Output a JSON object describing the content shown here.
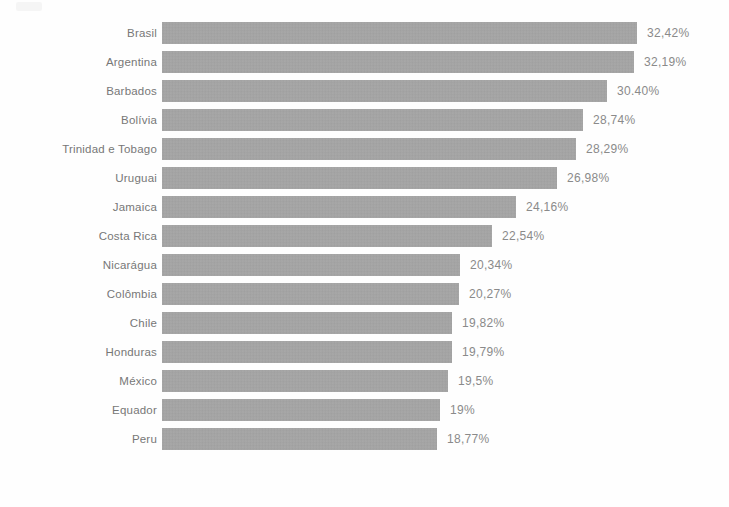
{
  "chart_data": {
    "type": "bar",
    "orientation": "horizontal",
    "title": "",
    "subtitle": "",
    "xlabel": "",
    "ylabel": "",
    "grid": false,
    "legend": null,
    "axis_ticks": [],
    "value_suffix": "%",
    "decimal_separator": ",",
    "xlim": [
      0,
      32.42
    ],
    "categories": [
      "Brasil",
      "Argentina",
      "Barbados",
      "Bolívia",
      "Trinidad e Tobago",
      "Uruguai",
      "Jamaica",
      "Costa Rica",
      "Nicarágua",
      "Colômbia",
      "Chile",
      "Honduras",
      "México",
      "Equador",
      "Peru"
    ],
    "values": [
      32.42,
      32.19,
      30.4,
      28.74,
      28.29,
      26.98,
      24.16,
      22.54,
      20.34,
      20.27,
      19.82,
      19.79,
      19.5,
      19.0,
      18.77
    ],
    "value_labels": [
      "32,42%",
      "32,19%",
      "30.40%",
      "28,74%",
      "28,29%",
      "26,98%",
      "24,16%",
      "22,54%",
      "20,34%",
      "20,27%",
      "19,82%",
      "19,79%",
      "19,5%",
      "19%",
      "18,77%"
    ],
    "bar_color": "#a3a3a3",
    "label_color": "#777777",
    "value_color": "#8a8a8a",
    "background_color": "#fefefe"
  }
}
